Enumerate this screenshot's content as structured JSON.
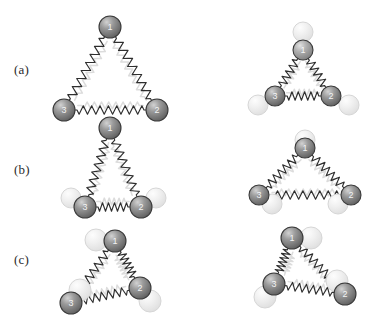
{
  "figure": {
    "background_color": "#ffffff",
    "width": 369,
    "height": 318,
    "colors": {
      "mass_fill_dark": "#6e6e6e",
      "mass_fill_mid": "#8a8a8a",
      "mass_fill_light": "#a8a8a8",
      "mass_ghost_fill": "#e8e8e8",
      "mass_outline": "#3a3a3a",
      "mass_ghost_outline": "#d6d6d6",
      "spring_stroke": "#2e2e2e",
      "spring_ghost_stroke": "#dcdcdc",
      "label_text": "#2b2b2b",
      "mass_number_text": "#ffffff"
    },
    "mass_labels": [
      "1",
      "2",
      "3"
    ],
    "rows": [
      {
        "key": "a",
        "label": "(a)",
        "label_x": 14,
        "label_y": 62,
        "description": "Symmetric breathing mode: all three masses move radially in phase",
        "panels": [
          {
            "side": "left",
            "variant": "large-equilateral",
            "ghosts_visible": false,
            "masses": [
              {
                "id": "1",
                "x": 110,
                "y": 27,
                "r": 11,
                "shade": "#6f6f6f"
              },
              {
                "id": "3",
                "x": 64,
                "y": 110,
                "r": 11,
                "shade": "#6f6f6f"
              },
              {
                "id": "2",
                "x": 157,
                "y": 110,
                "r": 11,
                "shade": "#6f6f6f"
              }
            ],
            "ghost_masses": [],
            "springs": [
              {
                "from": "1",
                "to": "3",
                "coils": 15,
                "ghost": false
              },
              {
                "from": "1",
                "to": "2",
                "coils": 15,
                "ghost": false
              },
              {
                "from": "3",
                "to": "2",
                "coils": 16,
                "ghost": false
              }
            ],
            "ghost_springs": [
              {
                "from": "1",
                "to": "3",
                "inset": 9
              },
              {
                "from": "1",
                "to": "2",
                "inset": 9
              },
              {
                "from": "3",
                "to": "2",
                "inset": 9
              }
            ]
          },
          {
            "side": "right",
            "variant": "small-equilateral-contracted",
            "ghosts_visible": true,
            "masses": [
              {
                "id": "1",
                "x": 303,
                "y": 50,
                "r": 10,
                "shade": "#787878"
              },
              {
                "id": "3",
                "x": 275,
                "y": 96,
                "r": 10,
                "shade": "#6f6f6f"
              },
              {
                "id": "2",
                "x": 331,
                "y": 96,
                "r": 10,
                "shade": "#6f6f6f"
              }
            ],
            "ghost_masses": [
              {
                "id": "1",
                "x": 303,
                "y": 32,
                "r": 10
              },
              {
                "id": "3",
                "x": 258,
                "y": 105,
                "r": 10
              },
              {
                "id": "2",
                "x": 349,
                "y": 105,
                "r": 10
              }
            ],
            "springs": [
              {
                "from": "1",
                "to": "3",
                "coils": 9,
                "ghost": false
              },
              {
                "from": "1",
                "to": "2",
                "coils": 9,
                "ghost": false
              },
              {
                "from": "3",
                "to": "2",
                "coils": 10,
                "ghost": false
              }
            ],
            "ghost_springs": [
              {
                "from": "1",
                "to": "3",
                "inset": 7
              },
              {
                "from": "1",
                "to": "2",
                "inset": 7
              },
              {
                "from": "3",
                "to": "2",
                "inset": 7
              }
            ]
          }
        ]
      },
      {
        "key": "b",
        "label": "(b)",
        "label_x": 14,
        "label_y": 162,
        "description": "Degenerate mode: apex mass fixed, base masses move apart and together",
        "panels": [
          {
            "side": "left",
            "variant": "tall-narrow",
            "ghosts_visible": true,
            "masses": [
              {
                "id": "1",
                "x": 110,
                "y": 128,
                "r": 11,
                "shade": "#6f6f6f"
              },
              {
                "id": "3",
                "x": 85,
                "y": 207,
                "r": 11,
                "shade": "#6f6f6f"
              },
              {
                "id": "2",
                "x": 141,
                "y": 207,
                "r": 11,
                "shade": "#6f6f6f"
              }
            ],
            "ghost_masses": [
              {
                "id": "3",
                "x": 71,
                "y": 198,
                "r": 10
              },
              {
                "id": "2",
                "x": 156,
                "y": 198,
                "r": 10
              }
            ],
            "springs": [
              {
                "from": "1",
                "to": "3",
                "coils": 14,
                "ghost": false
              },
              {
                "from": "1",
                "to": "2",
                "coils": 14,
                "ghost": false
              },
              {
                "from": "3",
                "to": "2",
                "coils": 10,
                "ghost": false
              }
            ],
            "ghost_springs": [
              {
                "from": "1",
                "to": "3",
                "inset": 9
              },
              {
                "from": "1",
                "to": "2",
                "inset": 9
              },
              {
                "from": "3",
                "to": "2",
                "inset": 8
              }
            ]
          },
          {
            "side": "right",
            "variant": "wide-flat",
            "ghosts_visible": true,
            "masses": [
              {
                "id": "1",
                "x": 305,
                "y": 148,
                "r": 10,
                "shade": "#6f6f6f"
              },
              {
                "id": "3",
                "x": 259,
                "y": 195,
                "r": 10,
                "shade": "#6f6f6f"
              },
              {
                "id": "2",
                "x": 351,
                "y": 195,
                "r": 10,
                "shade": "#6f6f6f"
              }
            ],
            "ghost_masses": [
              {
                "id": "1",
                "x": 305,
                "y": 140,
                "r": 10
              },
              {
                "id": "3",
                "x": 272,
                "y": 204,
                "r": 10
              },
              {
                "id": "2",
                "x": 338,
                "y": 204,
                "r": 10
              }
            ],
            "springs": [
              {
                "from": "1",
                "to": "3",
                "coils": 12,
                "ghost": false
              },
              {
                "from": "1",
                "to": "2",
                "coils": 12,
                "ghost": false
              },
              {
                "from": "3",
                "to": "2",
                "coils": 16,
                "ghost": false
              }
            ],
            "ghost_springs": [
              {
                "from": "1",
                "to": "3",
                "inset": 8
              },
              {
                "from": "1",
                "to": "2",
                "inset": 8
              },
              {
                "from": "3",
                "to": "2",
                "inset": 8
              }
            ]
          }
        ]
      },
      {
        "key": "c",
        "label": "(c)",
        "label_x": 14,
        "label_y": 252,
        "description": "Rotational / shear mode: all masses displaced tangentially",
        "panels": [
          {
            "side": "left",
            "variant": "rotated-ccw",
            "ghosts_visible": true,
            "masses": [
              {
                "id": "1",
                "x": 115,
                "y": 241,
                "r": 11,
                "shade": "#6f6f6f"
              },
              {
                "id": "3",
                "x": 71,
                "y": 303,
                "r": 11,
                "shade": "#6f6f6f"
              },
              {
                "id": "2",
                "x": 140,
                "y": 288,
                "r": 11,
                "shade": "#6f6f6f"
              }
            ],
            "ghost_masses": [
              {
                "id": "1",
                "x": 96,
                "y": 240,
                "r": 11
              },
              {
                "id": "3",
                "x": 80,
                "y": 290,
                "r": 11
              },
              {
                "id": "2",
                "x": 150,
                "y": 301,
                "r": 11
              }
            ],
            "springs": [
              {
                "from": "1",
                "to": "3",
                "coils": 13,
                "ghost": false
              },
              {
                "from": "1",
                "to": "2",
                "coils": 11,
                "ghost": false
              },
              {
                "from": "3",
                "to": "2",
                "coils": 13,
                "ghost": false
              }
            ],
            "ghost_springs": [
              {
                "from": "1",
                "to": "3",
                "inset": 9
              },
              {
                "from": "1",
                "to": "2",
                "inset": 9
              },
              {
                "from": "3",
                "to": "2",
                "inset": 9
              }
            ]
          },
          {
            "side": "right",
            "variant": "rotated-cw",
            "ghosts_visible": true,
            "masses": [
              {
                "id": "1",
                "x": 292,
                "y": 238,
                "r": 11,
                "shade": "#6f6f6f"
              },
              {
                "id": "3",
                "x": 274,
                "y": 284,
                "r": 11,
                "shade": "#6f6f6f"
              },
              {
                "id": "2",
                "x": 345,
                "y": 294,
                "r": 11,
                "shade": "#6f6f6f"
              }
            ],
            "ghost_masses": [
              {
                "id": "1",
                "x": 311,
                "y": 238,
                "r": 11
              },
              {
                "id": "3",
                "x": 265,
                "y": 297,
                "r": 11
              },
              {
                "id": "2",
                "x": 337,
                "y": 281,
                "r": 11
              }
            ],
            "springs": [
              {
                "from": "1",
                "to": "3",
                "coils": 11,
                "ghost": false
              },
              {
                "from": "1",
                "to": "2",
                "coils": 14,
                "ghost": false
              },
              {
                "from": "3",
                "to": "2",
                "coils": 13,
                "ghost": false
              }
            ],
            "ghost_springs": [
              {
                "from": "1",
                "to": "3",
                "inset": 9
              },
              {
                "from": "1",
                "to": "2",
                "inset": 9
              },
              {
                "from": "3",
                "to": "2",
                "inset": 9
              }
            ]
          }
        ]
      }
    ]
  }
}
